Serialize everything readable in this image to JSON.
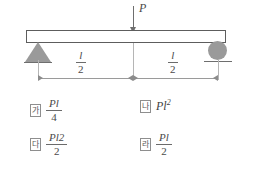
{
  "diagram": {
    "load_label": "P",
    "left_support": "pin-support-triangle",
    "right_support": "roller-support-circle",
    "beam": "horizontal-beam",
    "dim_left": {
      "numerator": "l",
      "denominator": "2"
    },
    "dim_right": {
      "numerator": "l",
      "denominator": "2"
    }
  },
  "options": [
    {
      "marker": "가",
      "numerator": "Pl",
      "denominator": "4",
      "plain": ""
    },
    {
      "marker": "나",
      "numerator": "",
      "denominator": "",
      "plain": "Pl",
      "sup": "2"
    },
    {
      "marker": "다",
      "numerator": "Pl",
      "sup": "2",
      "denominator": "2",
      "plain": ""
    },
    {
      "marker": "라",
      "numerator": "Pl",
      "denominator": "2",
      "plain": ""
    }
  ],
  "colors": {
    "support": "#9a9a9a",
    "beam_outline": "#5d5d5d",
    "dimension": "#9a9a9a",
    "text": "#4a4a4a",
    "background": "#ffffff"
  }
}
